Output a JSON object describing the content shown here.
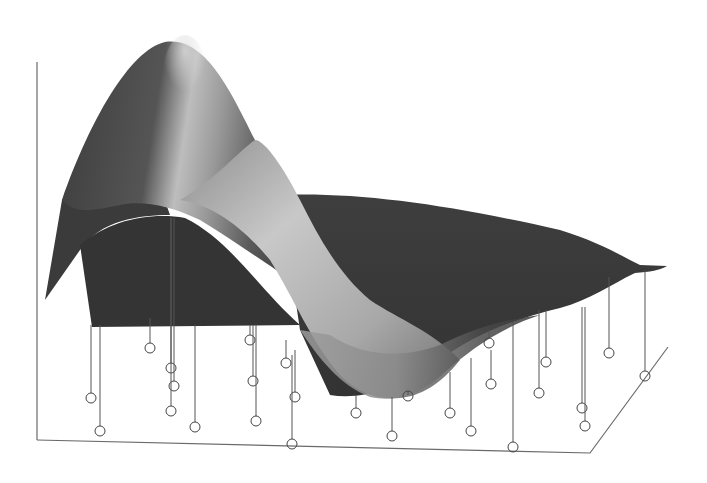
{
  "chart_data": {
    "type": "surface3d",
    "title": "",
    "xlabel": "",
    "ylabel": "",
    "zlabel": "",
    "grid": false,
    "legend": null,
    "colors": {
      "surface_dark": "#3a3a3a",
      "surface_light": "#d0d0d0",
      "frame": "#6a6a6a",
      "stem": "#555555",
      "background": "#ffffff"
    },
    "frame": {
      "back_vertical": [
        [
          37,
          62
        ],
        [
          37,
          440
        ]
      ],
      "floor": [
        [
          37,
          440
        ],
        [
          590,
          453
        ],
        [
          668,
          347
        ]
      ]
    },
    "stems": [
      {
        "x": 91,
        "top": 325,
        "y": 398
      },
      {
        "x": 100,
        "top": 325,
        "y": 431
      },
      {
        "x": 150,
        "top": 318,
        "y": 348
      },
      {
        "x": 171,
        "top": 218,
        "y": 368
      },
      {
        "x": 174,
        "top": 218,
        "y": 386
      },
      {
        "x": 171,
        "top": 218,
        "y": 411
      },
      {
        "x": 195,
        "top": 325,
        "y": 427
      },
      {
        "x": 250,
        "top": 325,
        "y": 340
      },
      {
        "x": 253,
        "top": 325,
        "y": 381
      },
      {
        "x": 256,
        "top": 325,
        "y": 421
      },
      {
        "x": 286,
        "top": 340,
        "y": 363
      },
      {
        "x": 295,
        "top": 350,
        "y": 397
      },
      {
        "x": 292,
        "top": 355,
        "y": 444
      },
      {
        "x": 356,
        "top": 395,
        "y": 413
      },
      {
        "x": 392,
        "top": 397,
        "y": 436
      },
      {
        "x": 408,
        "top": 395,
        "y": 396
      },
      {
        "x": 450,
        "top": 372,
        "y": 413
      },
      {
        "x": 471,
        "top": 358,
        "y": 431
      },
      {
        "x": 489,
        "top": 330,
        "y": 343
      },
      {
        "x": 491,
        "top": 350,
        "y": 384
      },
      {
        "x": 513,
        "top": 322,
        "y": 447
      },
      {
        "x": 539,
        "top": 310,
        "y": 393
      },
      {
        "x": 546,
        "top": 310,
        "y": 362
      },
      {
        "x": 582,
        "top": 307,
        "y": 408
      },
      {
        "x": 585,
        "top": 307,
        "y": 426
      },
      {
        "x": 609,
        "top": 277,
        "y": 353
      },
      {
        "x": 645,
        "top": 270,
        "y": 376
      }
    ]
  }
}
